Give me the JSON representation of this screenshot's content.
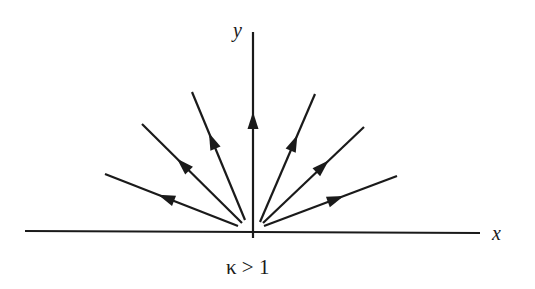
{
  "diagram": {
    "type": "phase-portrait",
    "labels": {
      "x_axis": "x",
      "y_axis": "y",
      "caption": "κ > 1"
    },
    "colors": {
      "stroke": "#1a1a1a",
      "background": "#ffffff"
    },
    "axes": {
      "x": {
        "x1": 25,
        "y1": 231,
        "x2": 480,
        "y2": 233
      },
      "y": {
        "x1": 253,
        "y1": 32,
        "x2": 253,
        "y2": 238
      }
    },
    "trajectories": [
      {
        "name": "far-left",
        "from": [
          238,
          226
        ],
        "to": [
          105,
          174
        ],
        "arrow_at": 0.6
      },
      {
        "name": "left-mid",
        "from": [
          242,
          223
        ],
        "to": [
          142,
          124
        ],
        "arrow_at": 0.65
      },
      {
        "name": "left-upper",
        "from": [
          245,
          220
        ],
        "to": [
          192,
          92
        ],
        "arrow_at": 0.68
      },
      {
        "name": "vertical",
        "from": [
          253,
          200
        ],
        "to": [
          253,
          110
        ],
        "arrow_at": 0.9
      },
      {
        "name": "right-upper",
        "from": [
          260,
          222
        ],
        "to": [
          315,
          94
        ],
        "arrow_at": 0.68
      },
      {
        "name": "right-mid",
        "from": [
          263,
          223
        ],
        "to": [
          364,
          127
        ],
        "arrow_at": 0.65
      },
      {
        "name": "right-low",
        "from": [
          264,
          226
        ],
        "to": [
          397,
          176
        ],
        "arrow_at": 0.6
      }
    ]
  }
}
